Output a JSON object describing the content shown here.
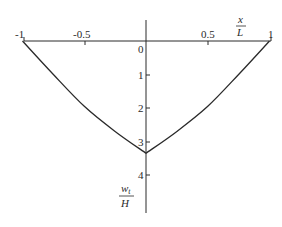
{
  "chart_data": {
    "type": "line",
    "title": "",
    "xlabel": {
      "num": "x",
      "den": "L"
    },
    "ylabel": {
      "num": "w",
      "sub": "t",
      "den": "H"
    },
    "x_ticks": [
      "-1",
      "-0.5",
      "0.5",
      "1"
    ],
    "y_ticks": [
      "0",
      "1",
      "2",
      "3",
      "4"
    ],
    "xlim": [
      -1,
      1
    ],
    "ylim": [
      0,
      5
    ],
    "y_inverted": true,
    "grid": false,
    "legend": null,
    "series": [
      {
        "name": "w_t/H",
        "x": [
          -1,
          -0.75,
          -0.5,
          -0.25,
          0,
          0.25,
          0.5,
          0.75,
          1
        ],
        "y": [
          0,
          1.0,
          1.95,
          2.7,
          3.35,
          2.7,
          1.95,
          1.0,
          0
        ]
      }
    ]
  }
}
